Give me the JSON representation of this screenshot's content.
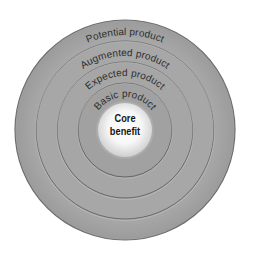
{
  "diagram": {
    "center": {
      "x": 125,
      "y": 130
    },
    "background": "#ffffff",
    "rings": [
      {
        "id": "potential",
        "label": "Potential product",
        "radius": 110,
        "label_radius": 95,
        "fill": "#a9a9a9",
        "stroke": "#6e6e6e"
      },
      {
        "id": "augmented",
        "label": "Augmented product",
        "radius": 89,
        "label_radius": 74,
        "fill": "#a7a7a7",
        "stroke": "#6a6a6a"
      },
      {
        "id": "expected",
        "label": "Expected product",
        "radius": 68,
        "label_radius": 54,
        "fill": "#a6a6a6",
        "stroke": "#686868"
      },
      {
        "id": "basic",
        "label": "Basic product",
        "radius": 47,
        "label_radius": 33,
        "fill": "#a1a1a1",
        "stroke": "#666666"
      }
    ],
    "core": {
      "label_line1": "Core",
      "label_line2": "benefit",
      "radius": 27,
      "fill_center": "#ffffff",
      "fill_edge": "#d6d6d6"
    }
  }
}
